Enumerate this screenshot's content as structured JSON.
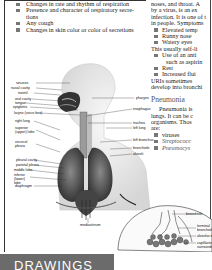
{
  "left_column": {
    "bullets": [
      "Changes in rate and rhythm of respiration",
      "Presence and character of respiratory secre-tions",
      "Any cough",
      "Changes in skin color or color of secretions"
    ]
  },
  "right_column": {
    "intro_lines": [
      "noses, and throat. A",
      "by a virus, is an ex",
      "infection. It is one of t",
      "in people. Symptoms"
    ],
    "symptoms": [
      "Elevated temp",
      "Runny nose",
      "Watery eyes"
    ],
    "self_limiting": "This usually self-li",
    "treatments": [
      "Use of an anti",
      "Rest",
      "Increased flui"
    ],
    "treatment_cont": "such as aspirin",
    "uri_lines": [
      "URIs sometimes",
      "develop into bronchi"
    ],
    "pneumonia_heading": "Pneumonia",
    "pneumonia_lines": [
      "Pneumonia is",
      "lungs. It can be c",
      "organisms. Thos",
      "are:"
    ],
    "organisms": [
      "viruses",
      "Streptococc",
      "Pneumocys"
    ]
  },
  "diagram_labels": {
    "left": [
      "sinuses",
      "nasal cavity",
      "nostril",
      "oral cavity",
      "tongue",
      "epiglottis",
      "larynx (voice box)",
      "right lung",
      "superior (upper) lobe",
      "visceral pleura",
      "pleural cavity",
      "parietal pleura",
      "middle lobe",
      "inferior (lower) lobe",
      "diaphragm"
    ],
    "right": [
      "pharynx",
      "esophagus",
      "trachea",
      "left lung",
      "left bronchus",
      "bronchiole",
      "alveoli"
    ],
    "bottom": "mediastinum",
    "inset": [
      "bronchiole",
      "terminal bronchiole",
      "alveolar d",
      "capillaries surrounding"
    ]
  },
  "banner": {
    "text": "DRAWINGS"
  }
}
